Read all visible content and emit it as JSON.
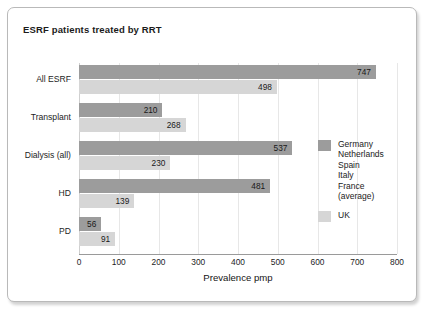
{
  "chart_data": {
    "type": "bar",
    "orientation": "horizontal",
    "title": "ESRF patients treated by RRT",
    "xlabel": "Prevalence pmp",
    "ylabel": "",
    "xlim": [
      0,
      800
    ],
    "xticks": [
      0,
      100,
      200,
      300,
      400,
      500,
      600,
      700,
      800
    ],
    "grid": "vertical",
    "legend_position": "right-middle",
    "categories": [
      "All ESRF",
      "Transplant",
      "Dialysis (all)",
      "HD",
      "PD"
    ],
    "series": [
      {
        "name": "Germany\nNetherlands\nSpain\nItaly\nFrance\n(average)",
        "short_name": "average",
        "color": "#9c9c9c",
        "values": [
          747,
          210,
          537,
          481,
          56
        ]
      },
      {
        "name": "UK",
        "short_name": "UK",
        "color": "#d6d6d6",
        "values": [
          498,
          268,
          230,
          139,
          91
        ]
      }
    ]
  },
  "legend": {
    "entries": [
      {
        "label": "Germany\nNetherlands\nSpain\nItaly\nFrance\n(average)",
        "swatch": "avg"
      },
      {
        "label": "UK",
        "swatch": "uk"
      }
    ]
  },
  "colors": {
    "series_average": "#9c9c9c",
    "series_uk": "#d6d6d6",
    "frame_border": "#b9b9b9",
    "gridline": "#e7e7e7",
    "axis_line": "#9a9a9a",
    "text": "#1b1b1b",
    "background": "#ffffff"
  }
}
